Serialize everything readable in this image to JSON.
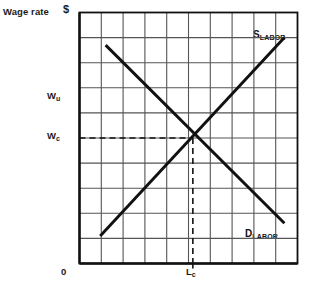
{
  "figure": {
    "y_axis_title": "Wage rate",
    "y_axis_unit": "$",
    "origin_label": "0",
    "bottom_caption": "",
    "labels": {
      "wage_union": "W",
      "wage_union_sub": "u",
      "wage_competitive": "W",
      "wage_competitive_sub": "c",
      "labor_competitive": "L",
      "labor_competitive_sub": "c",
      "supply": "S",
      "supply_sub": "LABOR",
      "demand": "D",
      "demand_sub": "LABOR"
    },
    "colors": {
      "curve": "#111111",
      "grid": "#555555",
      "axis": "#111111",
      "dashed": "#111111",
      "background": "#ffffff"
    }
  },
  "chart_data": {
    "type": "line",
    "title": "",
    "xlabel": "",
    "ylabel": "Wage rate ($)",
    "grid": true,
    "legend_position": "inline-right",
    "xlim": [
      0,
      10
    ],
    "ylim": [
      0,
      10
    ],
    "grid_columns": 10,
    "grid_rows": 10,
    "xticks": [
      0,
      1,
      2,
      3,
      4,
      5,
      6,
      7,
      8,
      9,
      10
    ],
    "yticks": [
      0,
      1,
      2,
      3,
      4,
      5,
      6,
      7,
      8,
      9,
      10
    ],
    "annotations": [
      {
        "label": "W_u",
        "axis": "y",
        "value": 6.6,
        "note": "union wage above equilibrium"
      },
      {
        "label": "W_c",
        "axis": "y",
        "value": 5.0,
        "note": "competitive equilibrium wage"
      },
      {
        "label": "L_c",
        "axis": "x",
        "value": 5.2,
        "note": "competitive equilibrium quantity of labor"
      },
      {
        "label": "0",
        "axis": "origin",
        "value": 0,
        "note": "origin"
      }
    ],
    "dashed_guides": [
      {
        "orientation": "horizontal",
        "from": [
          0,
          5.0
        ],
        "to": [
          5.2,
          5.0
        ],
        "label": "W_c guide"
      },
      {
        "orientation": "vertical",
        "from": [
          5.2,
          5.0
        ],
        "to": [
          5.2,
          0
        ],
        "label": "L_c guide"
      }
    ],
    "series": [
      {
        "name": "D_LABOR",
        "label": "Demand for labor",
        "slope": "negative",
        "points": [
          [
            1.2,
            8.7
          ],
          [
            9.4,
            1.6
          ]
        ]
      },
      {
        "name": "S_LABOR",
        "label": "Supply of labor",
        "slope": "positive",
        "points": [
          [
            0.95,
            1.1
          ],
          [
            9.4,
            9.0
          ]
        ]
      }
    ],
    "equilibrium": {
      "x": 5.2,
      "y": 5.0
    }
  }
}
